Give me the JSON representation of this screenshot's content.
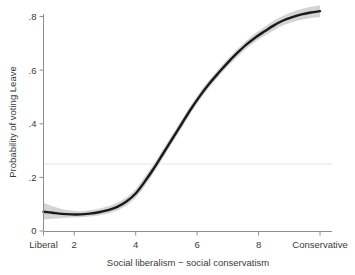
{
  "chart_data": {
    "type": "line",
    "title": "",
    "subtitle": "",
    "xlabel": "Social liberalism − social conservatism",
    "ylabel": "Probability of voting Leave",
    "xlim": [
      1,
      10
    ],
    "ylim": [
      0,
      0.85
    ],
    "grid": true,
    "grid_lines_y": [
      0.25
    ],
    "legend": "none",
    "x_tick_values": [
      1,
      2,
      4,
      6,
      8,
      10
    ],
    "x_tick_labels": [
      "Liberal",
      "2",
      "4",
      "6",
      "8",
      "Conservative"
    ],
    "y_tick_values": [
      0,
      0.2,
      0.4,
      0.6,
      0.8
    ],
    "y_tick_labels": [
      "0",
      ".2",
      ".4",
      ".6",
      ".8"
    ],
    "series": [
      {
        "name": "Predicted probability of voting Leave",
        "style": "solid-black-line",
        "x": [
          1.0,
          1.3,
          1.6,
          1.9,
          2.2,
          2.5,
          2.8,
          3.1,
          3.4,
          3.7,
          4.0,
          4.3,
          4.6,
          4.9,
          5.2,
          5.5,
          5.8,
          6.1,
          6.4,
          6.7,
          7.0,
          7.3,
          7.6,
          7.9,
          8.2,
          8.5,
          8.8,
          9.1,
          9.4,
          9.7,
          10.0
        ],
        "values": [
          0.072,
          0.068,
          0.064,
          0.062,
          0.062,
          0.065,
          0.07,
          0.078,
          0.09,
          0.11,
          0.14,
          0.185,
          0.235,
          0.29,
          0.345,
          0.4,
          0.455,
          0.505,
          0.55,
          0.59,
          0.628,
          0.663,
          0.695,
          0.722,
          0.745,
          0.767,
          0.785,
          0.798,
          0.808,
          0.815,
          0.82
        ]
      }
    ],
    "confidence_band": {
      "name": "95% confidence interval",
      "fill": "#b9b9b9",
      "x": [
        1.0,
        1.3,
        1.6,
        1.9,
        2.2,
        2.5,
        2.8,
        3.1,
        3.4,
        3.7,
        4.0,
        4.3,
        4.6,
        4.9,
        5.2,
        5.5,
        5.8,
        6.1,
        6.4,
        6.7,
        7.0,
        7.3,
        7.6,
        7.9,
        8.2,
        8.5,
        8.8,
        9.1,
        9.4,
        9.7,
        10.0
      ],
      "upper": [
        0.105,
        0.092,
        0.082,
        0.076,
        0.074,
        0.077,
        0.083,
        0.092,
        0.105,
        0.126,
        0.157,
        0.203,
        0.252,
        0.307,
        0.362,
        0.416,
        0.47,
        0.52,
        0.564,
        0.604,
        0.642,
        0.678,
        0.71,
        0.738,
        0.762,
        0.785,
        0.803,
        0.817,
        0.828,
        0.836,
        0.842
      ],
      "lower": [
        0.042,
        0.046,
        0.048,
        0.05,
        0.051,
        0.054,
        0.058,
        0.065,
        0.076,
        0.095,
        0.124,
        0.168,
        0.219,
        0.274,
        0.329,
        0.384,
        0.44,
        0.49,
        0.536,
        0.576,
        0.614,
        0.648,
        0.68,
        0.706,
        0.728,
        0.749,
        0.767,
        0.779,
        0.788,
        0.794,
        0.798
      ]
    }
  },
  "axes": {
    "y_title": "Probability of voting Leave",
    "x_title": "Social liberalism − social conservatism",
    "y_ticks": [
      {
        "label": ".8",
        "value": 0.8
      },
      {
        "label": ".6",
        "value": 0.6
      },
      {
        "label": ".4",
        "value": 0.4
      },
      {
        "label": ".2",
        "value": 0.2
      },
      {
        "label": "0",
        "value": 0
      }
    ],
    "x_ticks": [
      {
        "label": "Liberal",
        "value": 1
      },
      {
        "label": "2",
        "value": 2
      },
      {
        "label": "4",
        "value": 4
      },
      {
        "label": "6",
        "value": 6
      },
      {
        "label": "8",
        "value": 8
      },
      {
        "label": "Conservative",
        "value": 10
      }
    ]
  },
  "colors": {
    "line": "#1a1a1a",
    "band": "#b9b9b9",
    "axis": "#8e8e8e",
    "grid": "#e7e7e7",
    "background": "#ffffff",
    "text": "#3a3a3a"
  }
}
